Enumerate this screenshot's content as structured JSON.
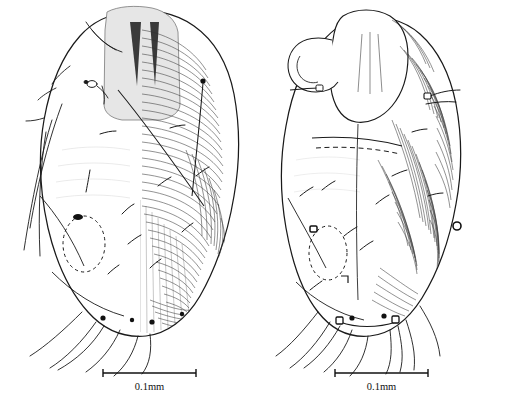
{
  "plate": {
    "background_color": "#ffffff",
    "ink_color": "#1a1a1a",
    "caption_top": "",
    "width": 518,
    "height": 398
  },
  "figures": [
    {
      "id": "left-specimen",
      "view_label": "",
      "scalebar": {
        "label": "0.1mm",
        "x_start": 103,
        "x_end": 196,
        "y": 373,
        "length_px": 93
      },
      "features": {
        "body_outline": "ovoid idiosoma",
        "striation": "dense transverse and oblique cuticular striae on right half",
        "dashed_structure": "genital opening, dashed oval",
        "dark_spot": "sclerotized pore at anterior of genital oval",
        "setae_count_visible": 18,
        "propodosomal_shield": "shaded rectangular shield with two dark longitudinal marks"
      }
    },
    {
      "id": "right-specimen",
      "view_label": "",
      "scalebar": {
        "label": "0.1mm",
        "x_start": 335,
        "x_end": 428,
        "y": 373,
        "length_px": 93
      },
      "features": {
        "body_outline": "ovoid idiosoma with produced anterior lobe",
        "striation": "dense longitudinal striae on right half",
        "dashed_structure": "genital opening, dashed oval",
        "dark_spot": "sclerotized pore at anterior of genital oval",
        "setae_count_visible": 16,
        "propodosomal_shield": "smooth shield with faint longitudinal lines"
      }
    }
  ],
  "colors": {
    "ink": "#1a1a1a",
    "striae": "#2b2b2b",
    "shade_fill": "#d8d8d8",
    "background": "#ffffff",
    "label_text": "#111111"
  }
}
